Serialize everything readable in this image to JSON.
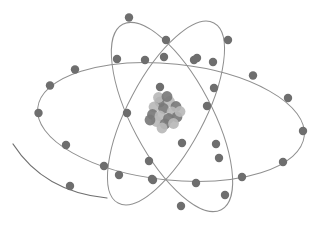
{
  "figure": {
    "name": "atom-diagram",
    "background_color": "#ffffff",
    "width": 320,
    "height": 227
  },
  "style": {
    "orbit_stroke_color": "#8f8f8f",
    "orbit_stroke_width": 1,
    "orbit_stroke_width_thin": 0.9,
    "electron_color": "#6e6e6e",
    "electron_radius": 4.2,
    "stray_arc_color": "#6f6f6f",
    "stray_arc_stroke_width": 1.2,
    "nucleon_color_dark": "#7a7a7a",
    "nucleon_color_light": "#b9b9b9",
    "nucleon_radius": 5.4
  },
  "nucleus": {
    "label": "nucleus",
    "center_x": 165,
    "center_y": 113,
    "radius": 17,
    "nucleons": [
      {
        "x": 160.0,
        "y": 102.0,
        "tone": "dark"
      },
      {
        "x": 169.5,
        "y": 101.5,
        "tone": "light"
      },
      {
        "x": 176.0,
        "y": 106.5,
        "tone": "dark"
      },
      {
        "x": 154.0,
        "y": 107.0,
        "tone": "light"
      },
      {
        "x": 163.5,
        "y": 108.5,
        "tone": "dark"
      },
      {
        "x": 172.0,
        "y": 112.0,
        "tone": "light"
      },
      {
        "x": 152.5,
        "y": 114.5,
        "tone": "dark"
      },
      {
        "x": 160.0,
        "y": 116.0,
        "tone": "light"
      },
      {
        "x": 168.5,
        "y": 118.5,
        "tone": "dark"
      },
      {
        "x": 177.0,
        "y": 117.0,
        "tone": "dark"
      },
      {
        "x": 156.5,
        "y": 121.5,
        "tone": "light"
      },
      {
        "x": 165.0,
        "y": 124.0,
        "tone": "dark"
      },
      {
        "x": 173.5,
        "y": 123.5,
        "tone": "light"
      },
      {
        "x": 158.5,
        "y": 97.5,
        "tone": "light"
      },
      {
        "x": 180.0,
        "y": 111.5,
        "tone": "light"
      },
      {
        "x": 150.0,
        "y": 120.0,
        "tone": "dark"
      },
      {
        "x": 167.0,
        "y": 96.5,
        "tone": "dark"
      },
      {
        "x": 162.0,
        "y": 128.0,
        "tone": "light"
      }
    ]
  },
  "orbits": [
    {
      "name": "orbit-horizontal",
      "label": "Horizontal orbit",
      "center_x": 171,
      "center_y": 122,
      "radius_x": 134,
      "radius_y": 58,
      "rotation_deg": 6,
      "electron_count": 12,
      "electrons": [
        {
          "x": 38.5,
          "y": 113.0
        },
        {
          "x": 50.0,
          "y": 85.5
        },
        {
          "x": 75.0,
          "y": 69.5
        },
        {
          "x": 117.0,
          "y": 59.0
        },
        {
          "x": 164.0,
          "y": 57.0
        },
        {
          "x": 213.0,
          "y": 62.0
        },
        {
          "x": 253.0,
          "y": 75.5
        },
        {
          "x": 288.0,
          "y": 98.0
        },
        {
          "x": 303.0,
          "y": 131.0
        },
        {
          "x": 283.0,
          "y": 162.0
        },
        {
          "x": 242.0,
          "y": 177.0
        },
        {
          "x": 196.0,
          "y": 183.0
        },
        {
          "x": 153.0,
          "y": 180.0
        },
        {
          "x": 104.0,
          "y": 166.0
        },
        {
          "x": 66.0,
          "y": 145.0
        }
      ]
    },
    {
      "name": "orbit-tilted-left",
      "label": "Left tilted orbit",
      "center_x": 172,
      "center_y": 117,
      "radius_x": 105,
      "radius_y": 40,
      "rotation_deg": 62,
      "electron_count": 10,
      "electrons": [
        {
          "x": 129.0,
          "y": 17.5
        },
        {
          "x": 166.0,
          "y": 40.0
        },
        {
          "x": 194.0,
          "y": 60.0
        },
        {
          "x": 160.0,
          "y": 87.0
        },
        {
          "x": 214.0,
          "y": 88.0
        },
        {
          "x": 182.0,
          "y": 143.0
        },
        {
          "x": 149.0,
          "y": 161.0
        },
        {
          "x": 219.0,
          "y": 158.0
        },
        {
          "x": 181.0,
          "y": 206.0
        },
        {
          "x": 152.0,
          "y": 179.0
        }
      ]
    },
    {
      "name": "orbit-tilted-right",
      "label": "Right tilted orbit",
      "center_x": 166,
      "center_y": 113,
      "radius_x": 102,
      "radius_y": 38,
      "rotation_deg": 118,
      "electron_count": 10,
      "electrons": [
        {
          "x": 228.0,
          "y": 40.0
        },
        {
          "x": 197.0,
          "y": 58.0
        },
        {
          "x": 145.0,
          "y": 60.0
        },
        {
          "x": 127.0,
          "y": 113.0
        },
        {
          "x": 216.0,
          "y": 144.0
        },
        {
          "x": 225.0,
          "y": 195.0
        },
        {
          "x": 119.0,
          "y": 175.0
        },
        {
          "x": 207.0,
          "y": 106.0
        }
      ]
    }
  ],
  "stray_arc": {
    "name": "stray-arc",
    "label": "Detached orbit arc fragment",
    "start_x": 13,
    "start_y": 144,
    "end_x": 107,
    "end_y": 198,
    "control_x": 44,
    "control_y": 192,
    "electron": {
      "x": 70.0,
      "y": 186.0
    }
  }
}
